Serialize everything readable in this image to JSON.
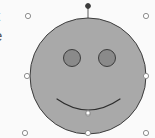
{
  "canvas": {
    "width": 155,
    "height": 138,
    "background_color": "#fafafa"
  },
  "clipped_labels": [
    {
      "text": "t",
      "note": "text clipped at left viewport edge"
    },
    {
      "text": "e",
      "note": "text clipped at left viewport edge"
    }
  ],
  "shape": {
    "name": "smiley-face",
    "face": {
      "cx": 88,
      "cy": 76,
      "rx": 58,
      "ry": 58,
      "fill": "#a9a9a9",
      "stroke": "#3c3c3c",
      "stroke_width": 1
    },
    "eyes": [
      {
        "label": "left-eye",
        "cx": 72,
        "cy": 58,
        "r": 8.5,
        "fill": "#8a8a8a",
        "stroke": "#3c3c3c"
      },
      {
        "label": "right-eye",
        "cx": 107,
        "cy": 58,
        "r": 8.5,
        "fill": "#8a8a8a",
        "stroke": "#3c3c3c"
      }
    ],
    "mouth": {
      "label": "smile",
      "path": "M 57 99 Q 88 121 120 99",
      "stroke": "#2e2e2e",
      "stroke_width": 1.2,
      "fill": "none"
    }
  },
  "selection": {
    "active": true,
    "handle_fill": "#ffffff",
    "handle_stroke": "#8d8d8d",
    "handle_radius": 2.6,
    "handles": [
      {
        "name": "handle-top-left",
        "x": 28,
        "y": 16
      },
      {
        "name": "handle-top-right",
        "x": 146,
        "y": 16
      },
      {
        "name": "handle-middle-left",
        "x": 27,
        "y": 76
      },
      {
        "name": "handle-middle-right",
        "x": 146,
        "y": 76
      },
      {
        "name": "handle-bottom-left",
        "x": 25,
        "y": 133
      },
      {
        "name": "handle-bottom-center",
        "x": 88,
        "y": 133
      },
      {
        "name": "handle-bottom-right",
        "x": 146,
        "y": 133
      }
    ],
    "anchor_points": [
      {
        "name": "anchor-face-bottom",
        "x": 88,
        "y": 114
      },
      {
        "name": "anchor-mouth-vertex",
        "x": 88,
        "y": 113
      }
    ],
    "rotation_handle": {
      "name": "rotation-handle",
      "x": 88,
      "y": 6,
      "r": 2.4,
      "fill": "#3c3c3c",
      "stroke": "#3c3c3c",
      "stem_from_y": 6,
      "stem_to_y": 19,
      "stem_stroke": "#5a5a5a"
    }
  }
}
